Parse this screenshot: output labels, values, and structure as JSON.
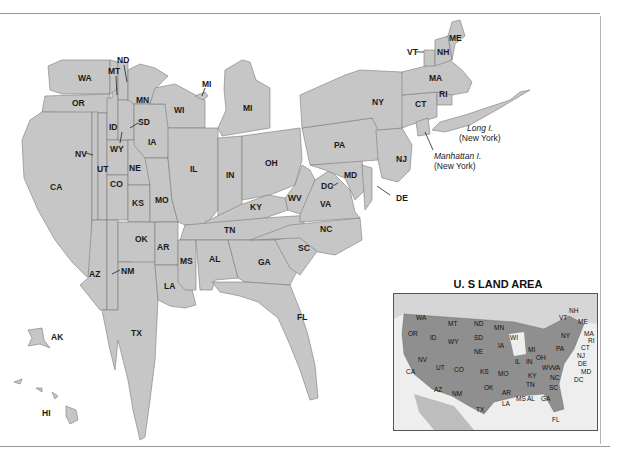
{
  "map": {
    "type": "cartogram",
    "subject": "U.S. states scaled by land area",
    "fill_color": "#c6c6c6",
    "border_color": "#7a7a7a",
    "state_labels": {
      "WA": "WA",
      "OR": "OR",
      "CA": "CA",
      "NV": "NV",
      "ID": "ID",
      "MT": "MT",
      "WY": "WY",
      "UT": "UT",
      "CO": "CO",
      "AZ": "AZ",
      "NM": "NM",
      "ND": "ND",
      "SD": "SD",
      "NE": "NE",
      "KS": "KS",
      "OK": "OK",
      "TX": "TX",
      "MN": "MN",
      "IA": "IA",
      "MO": "MO",
      "AR": "AR",
      "LA": "LA",
      "WI": "WI",
      "IL": "IL",
      "MI": "MI",
      "MI_UP": "MI",
      "IN": "IN",
      "OH": "OH",
      "KY": "KY",
      "TN": "TN",
      "MS": "MS",
      "AL": "AL",
      "GA": "GA",
      "FL": "FL",
      "SC": "SC",
      "NC": "NC",
      "VA": "VA",
      "WV": "WV",
      "DC": "DC",
      "MD": "MD",
      "DE": "DE",
      "PA": "PA",
      "NJ": "NJ",
      "NY": "NY",
      "CT": "CT",
      "RI": "RI",
      "MA": "MA",
      "VT": "VT",
      "NH": "NH",
      "ME": "ME",
      "AK": "AK",
      "HI": "HI"
    },
    "annotations": {
      "long_island_name": "Long I.",
      "long_island_state": "(New York)",
      "manhattan_name": "Manhattan I.",
      "manhattan_state": "(New York)"
    }
  },
  "inset": {
    "title": "U. S LAND AREA",
    "fill_color": "#8f8f8f",
    "labels": [
      "WA",
      "OR",
      "CA",
      "NV",
      "ID",
      "MT",
      "WY",
      "UT",
      "CO",
      "AZ",
      "NM",
      "ND",
      "SD",
      "NE",
      "KS",
      "OK",
      "TX",
      "MN",
      "IA",
      "MO",
      "AR",
      "LA",
      "WI",
      "IL",
      "MI",
      "IN",
      "OH",
      "KY",
      "TN",
      "MS",
      "AL",
      "GA",
      "FL",
      "SC",
      "NC",
      "VA",
      "WV",
      "PA",
      "NY",
      "VT",
      "NH",
      "ME",
      "MA",
      "RI",
      "CT",
      "NJ",
      "DE",
      "MD",
      "DC"
    ]
  }
}
